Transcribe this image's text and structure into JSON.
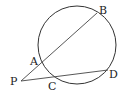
{
  "diagram": {
    "type": "geometry-secants",
    "circle": {
      "cx": 77,
      "cy": 45,
      "r": 39
    },
    "points": {
      "P": {
        "label": "P",
        "x": 21,
        "y": 81
      },
      "A": {
        "label": "A",
        "x": 40,
        "y": 64
      },
      "B": {
        "label": "B",
        "x": 97,
        "y": 13
      },
      "C": {
        "label": "C",
        "x": 54,
        "y": 77
      },
      "D": {
        "label": "D",
        "x": 108,
        "y": 70
      }
    },
    "segments": [
      {
        "from": "P",
        "to": "B",
        "through": "A"
      },
      {
        "from": "P",
        "to": "D",
        "through": "C"
      }
    ],
    "labels": {
      "P": "P",
      "A": "A",
      "B": "B",
      "C": "C",
      "D": "D"
    },
    "colors": {
      "stroke": "#333333",
      "text": "#222222",
      "background": "#ffffff"
    }
  }
}
